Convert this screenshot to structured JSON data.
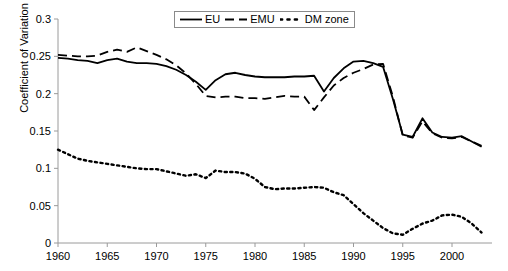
{
  "chart_data": {
    "type": "line",
    "title": "",
    "xlabel": "",
    "ylabel": "Coefficient of Variation",
    "xlim": [
      1960,
      2003
    ],
    "ylim": [
      0,
      0.3
    ],
    "grid": false,
    "legend_position": "top-center",
    "x_ticks": [
      "1960",
      "1965",
      "1970",
      "1975",
      "1980",
      "1985",
      "1990",
      "1995",
      "2000"
    ],
    "x_tick_values": [
      1960,
      1965,
      1970,
      1975,
      1980,
      1985,
      1990,
      1995,
      2000
    ],
    "y_ticks": [
      "0",
      "0.05",
      "0.1",
      "0.15",
      "0.2",
      "0.25",
      "0.3"
    ],
    "y_tick_values": [
      0,
      0.05,
      0.1,
      0.15,
      0.2,
      0.25,
      0.3
    ],
    "x": [
      1960,
      1961,
      1962,
      1963,
      1964,
      1965,
      1966,
      1967,
      1968,
      1969,
      1970,
      1971,
      1972,
      1973,
      1974,
      1975,
      1976,
      1977,
      1978,
      1979,
      1980,
      1981,
      1982,
      1983,
      1984,
      1985,
      1986,
      1987,
      1988,
      1989,
      1990,
      1991,
      1992,
      1993,
      1994,
      1995,
      1996,
      1997,
      1998,
      1999,
      2000,
      2001,
      2002,
      2003
    ],
    "series": [
      {
        "name": "EU",
        "style": "solid",
        "color": "#000000",
        "values": [
          0.248,
          0.247,
          0.245,
          0.244,
          0.241,
          0.245,
          0.247,
          0.243,
          0.241,
          0.241,
          0.24,
          0.237,
          0.232,
          0.225,
          0.216,
          0.205,
          0.218,
          0.226,
          0.228,
          0.225,
          0.223,
          0.222,
          0.222,
          0.222,
          0.223,
          0.223,
          0.224,
          0.203,
          0.221,
          0.234,
          0.243,
          0.244,
          0.241,
          0.236,
          0.193,
          0.145,
          0.142,
          0.167,
          0.148,
          0.142,
          0.141,
          0.143,
          0.136,
          0.129
        ]
      },
      {
        "name": "EMU",
        "style": "dashed",
        "color": "#000000",
        "values": [
          0.252,
          0.251,
          0.25,
          0.25,
          0.251,
          0.256,
          0.259,
          0.256,
          0.262,
          0.257,
          0.252,
          0.246,
          0.238,
          0.227,
          0.213,
          0.197,
          0.195,
          0.196,
          0.196,
          0.194,
          0.194,
          0.193,
          0.195,
          0.197,
          0.196,
          0.196,
          0.178,
          0.195,
          0.211,
          0.221,
          0.228,
          0.233,
          0.239,
          0.24,
          0.196,
          0.144,
          0.141,
          0.163,
          0.147,
          0.141,
          0.14,
          0.142,
          0.136,
          0.13
        ]
      },
      {
        "name": "DM zone",
        "style": "dotted",
        "color": "#000000",
        "values": [
          0.125,
          0.119,
          0.113,
          0.11,
          0.108,
          0.106,
          0.104,
          0.102,
          0.1,
          0.099,
          0.099,
          0.096,
          0.093,
          0.09,
          0.092,
          0.087,
          0.097,
          0.095,
          0.095,
          0.093,
          0.086,
          0.075,
          0.072,
          0.073,
          0.073,
          0.074,
          0.075,
          0.074,
          0.068,
          0.064,
          0.052,
          0.04,
          0.03,
          0.02,
          0.013,
          0.011,
          0.019,
          0.026,
          0.03,
          0.037,
          0.038,
          0.035,
          0.026,
          0.014
        ]
      }
    ]
  },
  "legend": {
    "items": [
      {
        "label": "EU",
        "style": "solid"
      },
      {
        "label": "EMU",
        "style": "dashed"
      },
      {
        "label": "DM zone",
        "style": "dotted"
      }
    ]
  }
}
